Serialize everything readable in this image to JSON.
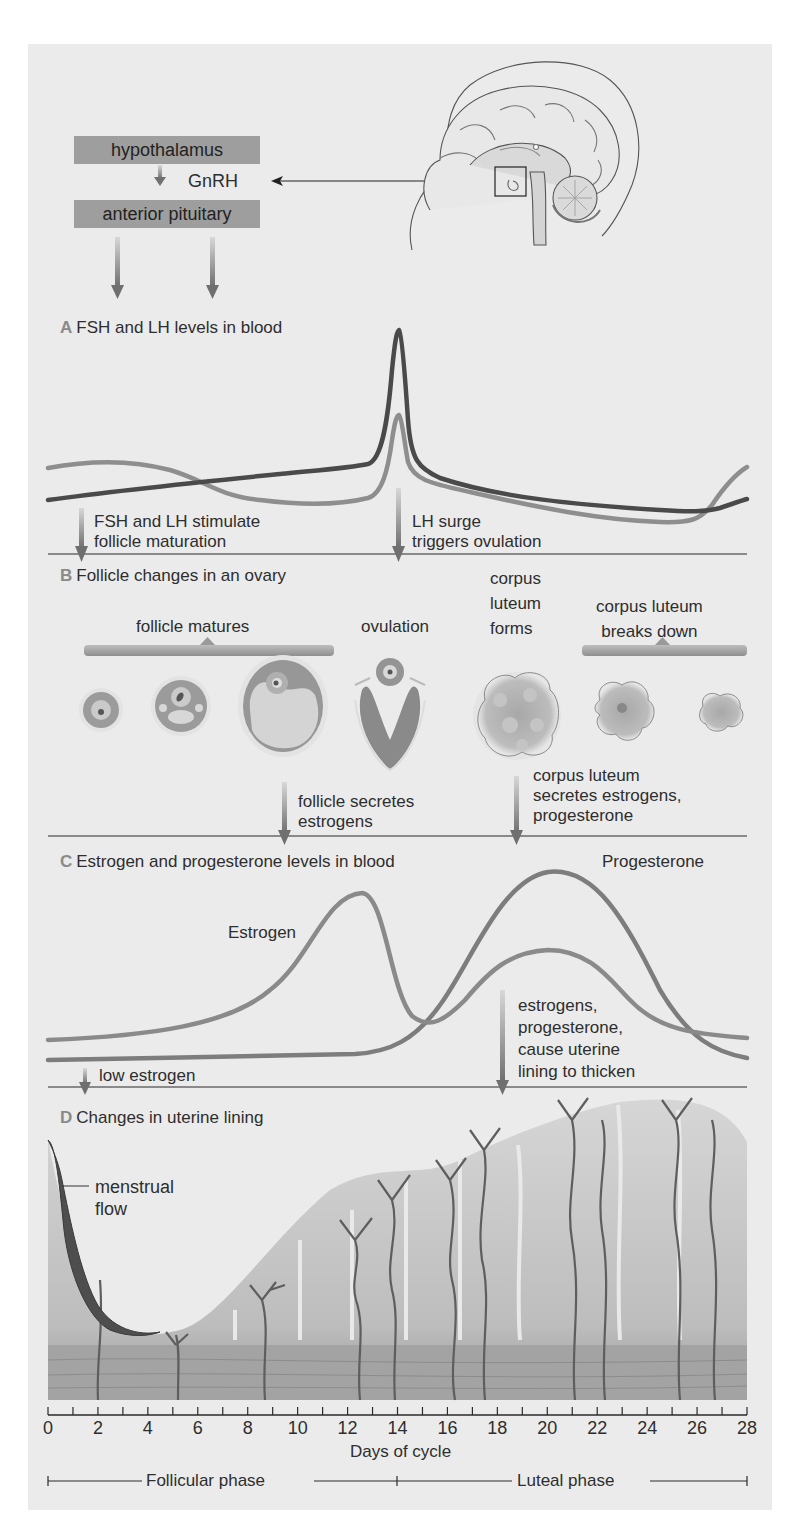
{
  "header": {
    "hypothalamus_box": "hypothalamus",
    "gnrh_label": "GnRH",
    "pituitary_box": "anterior pituitary"
  },
  "sections": {
    "a": {
      "letter": "A",
      "title": "FSH and LH levels in blood",
      "fsh_label": "FSH",
      "lh_label": "LH",
      "note_left": [
        "FSH and LH stimulate",
        "follicle maturation"
      ],
      "note_right": [
        "LH surge",
        "triggers ovulation"
      ]
    },
    "b": {
      "letter": "B",
      "title": "Follicle changes in an ovary",
      "stage_follicle_matures": "follicle matures",
      "stage_ovulation": "ovulation",
      "stage_cl_forms": [
        "corpus",
        "luteum",
        "forms"
      ],
      "stage_cl_breaks": [
        "corpus luteum",
        "breaks down"
      ],
      "note_left": [
        "follicle secretes",
        "estrogens"
      ],
      "note_right": [
        "corpus luteum",
        "secretes estrogens,",
        "progesterone"
      ]
    },
    "c": {
      "letter": "C",
      "title": "Estrogen and progesterone levels in blood",
      "estrogen_label": "Estrogen",
      "progesterone_label": "Progesterone",
      "note_left": "low estrogen",
      "note_right": [
        "estrogens,",
        "progesterone,",
        "cause uterine",
        "lining to thicken"
      ]
    },
    "d": {
      "letter": "D",
      "title": "Changes in uterine lining",
      "menstrual_label": [
        "menstrual",
        "flow"
      ]
    }
  },
  "axis": {
    "ticks": [
      "0",
      "2",
      "4",
      "6",
      "8",
      "10",
      "12",
      "14",
      "16",
      "18",
      "20",
      "22",
      "24",
      "26",
      "28"
    ],
    "title": "Days of cycle",
    "follicular": "Follicular phase",
    "luteal": "Luteal phase"
  },
  "colors": {
    "panel_bg": "#ebebeb",
    "box_gray": "#9e9e9e",
    "lh_dark": "#4a4a4a",
    "fsh_mid": "#8c8c8c",
    "estrogen": "#8a8a8a",
    "progesterone": "#7a7a7a"
  },
  "chart_data": [
    {
      "type": "line",
      "title": "FSH and LH levels in blood",
      "xlabel": "Days of cycle",
      "ylabel": "",
      "x": [
        0,
        2,
        4,
        6,
        8,
        10,
        12,
        13,
        13.5,
        14,
        14.5,
        15,
        16,
        18,
        20,
        22,
        24,
        25,
        26,
        27,
        28
      ],
      "series": [
        {
          "name": "FSH",
          "values": [
            62,
            63,
            61,
            50,
            40,
            37,
            38,
            45,
            62,
            92,
            62,
            40,
            33,
            29,
            26,
            25,
            24,
            24,
            30,
            48,
            60
          ]
        },
        {
          "name": "LH",
          "values": [
            34,
            38,
            42,
            45,
            48,
            51,
            55,
            60,
            95,
            100,
            88,
            52,
            45,
            39,
            35,
            32,
            31,
            31,
            32,
            35,
            38
          ]
        }
      ],
      "ylim": [
        0,
        100
      ],
      "grid": false,
      "legend": "inline labels"
    },
    {
      "type": "line",
      "title": "Estrogen and progesterone levels in blood",
      "xlabel": "Days of cycle",
      "ylabel": "",
      "x": [
        0,
        2,
        4,
        6,
        8,
        10,
        11,
        12,
        12.6,
        13.5,
        14,
        15,
        16,
        18,
        20,
        22,
        24,
        26,
        28
      ],
      "series": [
        {
          "name": "Estrogen",
          "values": [
            12,
            14,
            17,
            22,
            31,
            50,
            68,
            86,
            90,
            70,
            38,
            20,
            28,
            48,
            55,
            53,
            38,
            18,
            12
          ]
        },
        {
          "name": "Progesterone",
          "values": [
            5,
            5,
            5,
            6,
            6,
            7,
            8,
            10,
            12,
            16,
            22,
            36,
            55,
            85,
            98,
            93,
            62,
            22,
            8
          ]
        }
      ],
      "ylim": [
        0,
        100
      ],
      "grid": false,
      "legend": "inline labels"
    }
  ]
}
